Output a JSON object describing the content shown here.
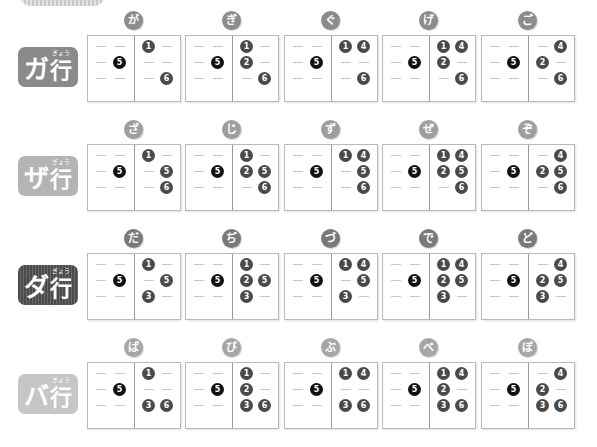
{
  "colors": {
    "dot": "#4a4a4a",
    "dot_prefix": "#111111",
    "box_border": "#b9b9b9",
    "dash": "#c8c8c8"
  },
  "rows": [
    {
      "label": "ガ",
      "gyo": "行",
      "ruby": "ぎょう",
      "label_color": "#8a8a8a",
      "label_style": "solid",
      "cells": [
        {
          "kana": "が",
          "prefix": [
            5
          ],
          "dots": [
            1,
            6
          ]
        },
        {
          "kana": "ぎ",
          "prefix": [
            5
          ],
          "dots": [
            1,
            2,
            6
          ]
        },
        {
          "kana": "ぐ",
          "prefix": [
            5
          ],
          "dots": [
            1,
            4,
            6
          ]
        },
        {
          "kana": "げ",
          "prefix": [
            5
          ],
          "dots": [
            1,
            2,
            4,
            6
          ]
        },
        {
          "kana": "ご",
          "prefix": [
            5
          ],
          "dots": [
            2,
            4,
            6
          ]
        }
      ]
    },
    {
      "label": "ザ",
      "gyo": "行",
      "ruby": "ぎょう",
      "label_color": "#b4b4b4",
      "label_style": "solid",
      "cells": [
        {
          "kana": "ざ",
          "prefix": [
            5
          ],
          "dots": [
            1,
            5,
            6
          ]
        },
        {
          "kana": "じ",
          "prefix": [
            5
          ],
          "dots": [
            1,
            2,
            5,
            6
          ]
        },
        {
          "kana": "ず",
          "prefix": [
            5
          ],
          "dots": [
            1,
            4,
            5,
            6
          ]
        },
        {
          "kana": "ぜ",
          "prefix": [
            5
          ],
          "dots": [
            1,
            2,
            4,
            5,
            6
          ]
        },
        {
          "kana": "ぞ",
          "prefix": [
            5
          ],
          "dots": [
            2,
            4,
            5,
            6
          ]
        }
      ]
    },
    {
      "label": "ダ",
      "gyo": "行",
      "ruby": "ぎょう",
      "label_color": "#555555",
      "label_style": "striped",
      "cells": [
        {
          "kana": "だ",
          "prefix": [
            5
          ],
          "dots": [
            1,
            3,
            5
          ]
        },
        {
          "kana": "ぢ",
          "prefix": [
            5
          ],
          "dots": [
            1,
            2,
            3,
            5
          ]
        },
        {
          "kana": "づ",
          "prefix": [
            5
          ],
          "dots": [
            1,
            3,
            4,
            5
          ]
        },
        {
          "kana": "で",
          "prefix": [
            5
          ],
          "dots": [
            1,
            2,
            3,
            4,
            5
          ]
        },
        {
          "kana": "ど",
          "prefix": [
            5
          ],
          "dots": [
            2,
            3,
            4,
            5
          ]
        }
      ]
    },
    {
      "label": "バ",
      "gyo": "行",
      "ruby": "ぎょう",
      "label_color": "#c6c6c6",
      "label_style": "solid",
      "cells": [
        {
          "kana": "ば",
          "prefix": [
            5
          ],
          "dots": [
            1,
            3,
            6
          ]
        },
        {
          "kana": "び",
          "prefix": [
            5
          ],
          "dots": [
            1,
            2,
            3,
            6
          ]
        },
        {
          "kana": "ぶ",
          "prefix": [
            5
          ],
          "dots": [
            1,
            3,
            4,
            6
          ]
        },
        {
          "kana": "べ",
          "prefix": [
            5
          ],
          "dots": [
            1,
            2,
            3,
            4,
            6
          ]
        },
        {
          "kana": "ぼ",
          "prefix": [
            5
          ],
          "dots": [
            2,
            3,
            4,
            6
          ]
        }
      ]
    }
  ]
}
